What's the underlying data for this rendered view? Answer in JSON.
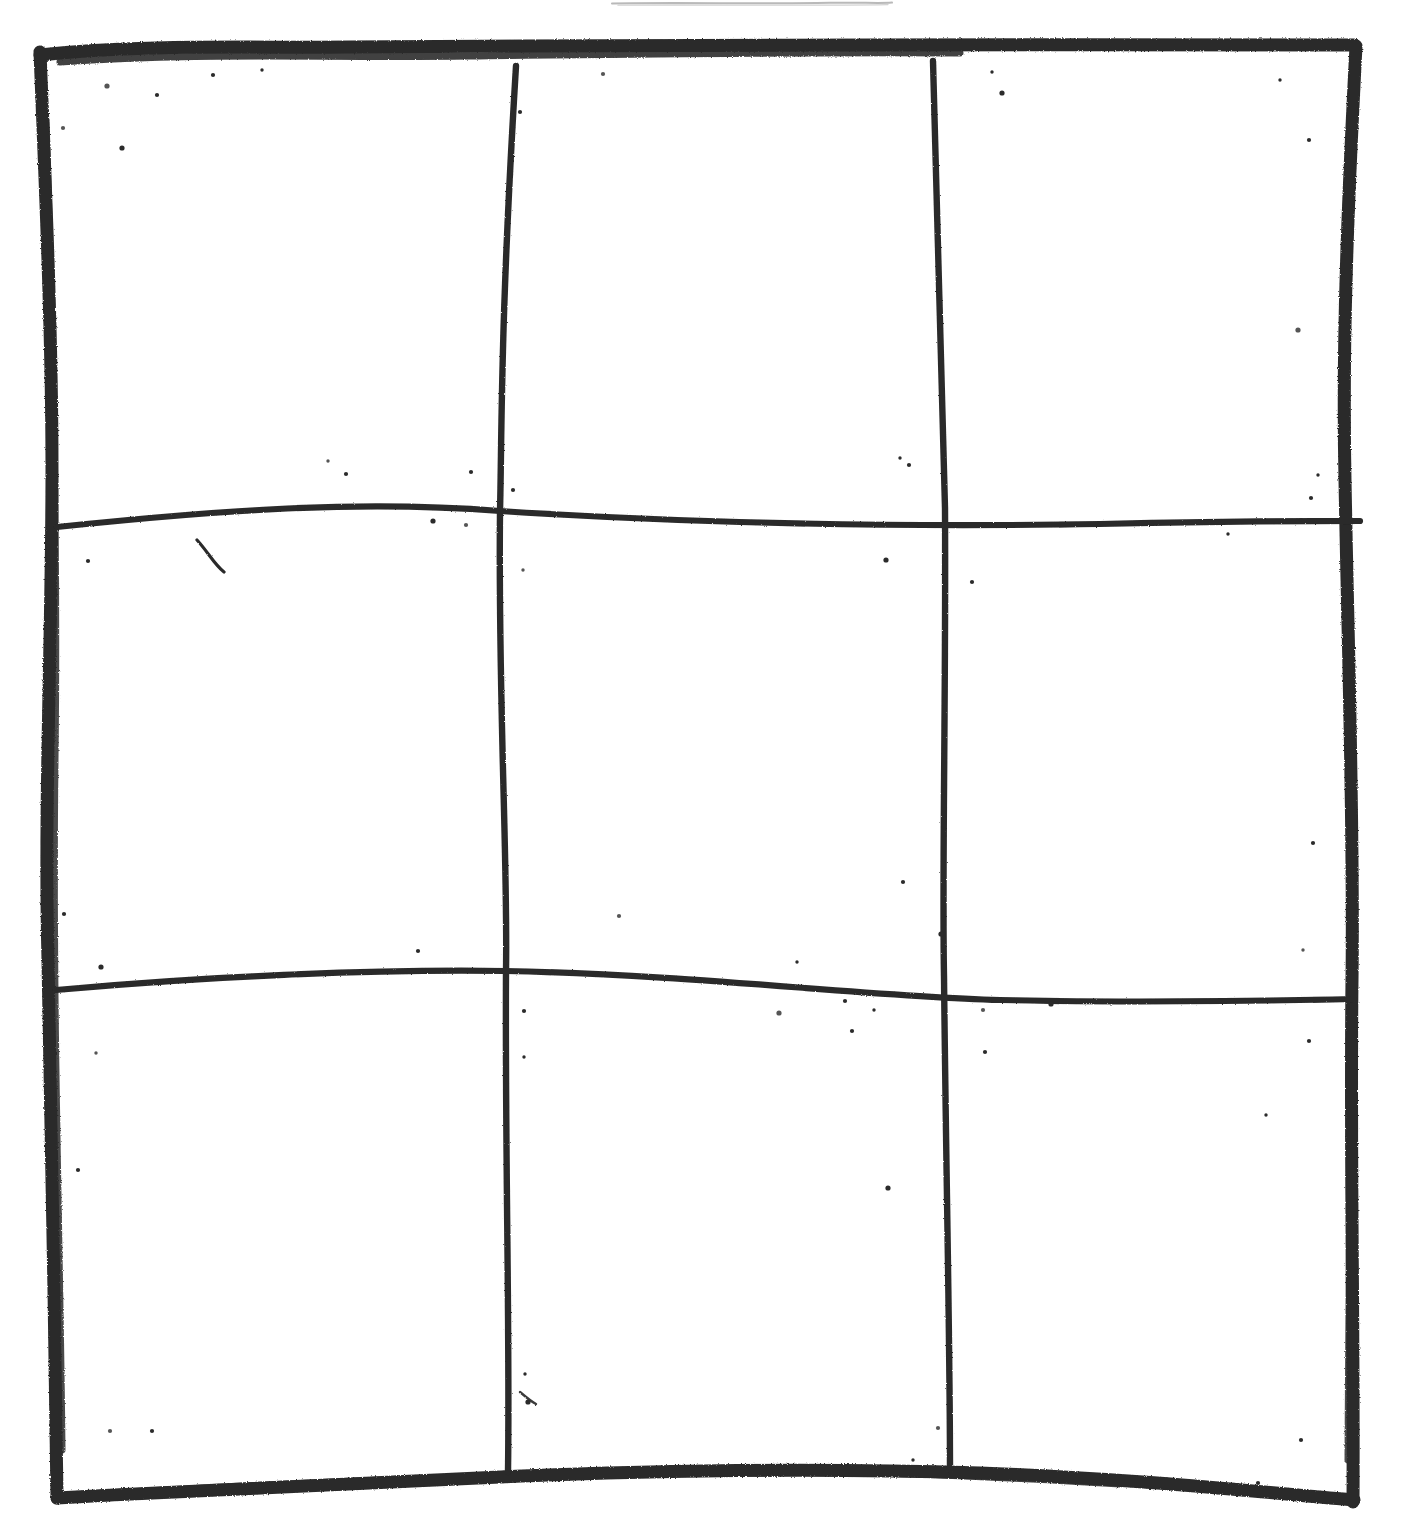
{
  "page": {
    "background_color": "#ffffff",
    "ink_color": "#2b2b2b",
    "ink_color_light": "#b9b9b9",
    "width": 1401,
    "height": 1540
  },
  "drawing": {
    "kind": "hand-drawn-grid",
    "medium": "thick black marker on white paper",
    "rows": 3,
    "columns": 3,
    "cell_count": 9,
    "border_stroke_width": 13,
    "interior_stroke_width": 6,
    "notes": "Empty tic-tac-toe style grid; no glyphs or text inside any cell; paper shows scattered dark speckles",
    "frame": {
      "top_left": [
        38,
        52
      ],
      "top_right": [
        1356,
        45
      ],
      "bottom_right": [
        1353,
        1500
      ],
      "bottom_left": [
        56,
        1496
      ]
    },
    "top_stray_mark": {
      "name": "faint-horizontal-pencil-line",
      "x1": 612,
      "x2": 892,
      "y": 3,
      "stroke_width": 2,
      "color": "#b9b9b9"
    },
    "interior_lines": [
      {
        "name": "vertical-line-1",
        "orientation": "vertical",
        "path": "M 516 66 C 500 330, 502 430, 500 512 C 498 700, 508 860, 506 972 C 505 1160, 510 1330, 508 1470"
      },
      {
        "name": "vertical-line-2",
        "orientation": "vertical",
        "path": "M 933 61 C 940 300, 944 430, 945 508 C 946 700, 942 870, 944 976 C 946 1170, 950 1340, 950 1468"
      },
      {
        "name": "horizontal-line-1",
        "orientation": "horizontal",
        "path": "M 57 527 C 220 510, 360 500, 500 511 C 700 524, 900 527, 1100 524 C 1220 521, 1300 521, 1358 521"
      },
      {
        "name": "horizontal-line-2",
        "orientation": "horizontal",
        "path": "M 56 990 C 200 977, 370 969, 505 971 C 700 975, 860 996, 1000 1000 C 1130 1003, 1260 1001, 1352 999"
      }
    ],
    "cells": [
      {
        "name": "cell-top-left",
        "row": 1,
        "col": 1,
        "content": ""
      },
      {
        "name": "cell-top-center",
        "row": 1,
        "col": 2,
        "content": ""
      },
      {
        "name": "cell-top-right",
        "row": 1,
        "col": 3,
        "content": ""
      },
      {
        "name": "cell-middle-left",
        "row": 2,
        "col": 1,
        "content": ""
      },
      {
        "name": "cell-middle-center",
        "row": 2,
        "col": 2,
        "content": ""
      },
      {
        "name": "cell-middle-right",
        "row": 2,
        "col": 3,
        "content": ""
      },
      {
        "name": "cell-bottom-left",
        "row": 3,
        "col": 1,
        "content": ""
      },
      {
        "name": "cell-bottom-center",
        "row": 3,
        "col": 2,
        "content": ""
      },
      {
        "name": "cell-bottom-right",
        "row": 3,
        "col": 3,
        "content": ""
      }
    ],
    "speckles": [
      [
        107,
        86
      ],
      [
        157,
        95
      ],
      [
        213,
        75
      ],
      [
        262,
        70
      ],
      [
        63,
        128
      ],
      [
        122,
        148
      ],
      [
        1280,
        80
      ],
      [
        1309,
        140
      ],
      [
        603,
        74
      ],
      [
        992,
        72
      ],
      [
        1002,
        93
      ],
      [
        520,
        112
      ],
      [
        328,
        461
      ],
      [
        346,
        474
      ],
      [
        471,
        472
      ],
      [
        433,
        521
      ],
      [
        466,
        525
      ],
      [
        513,
        490
      ],
      [
        900,
        458
      ],
      [
        909,
        465
      ],
      [
        1298,
        330
      ],
      [
        1318,
        475
      ],
      [
        1311,
        498
      ],
      [
        88,
        561
      ],
      [
        523,
        570
      ],
      [
        886,
        560
      ],
      [
        972,
        582
      ],
      [
        1228,
        534
      ],
      [
        1301,
        520
      ],
      [
        64,
        914
      ],
      [
        101,
        967
      ],
      [
        418,
        951
      ],
      [
        619,
        916
      ],
      [
        797,
        962
      ],
      [
        903,
        882
      ],
      [
        941,
        934
      ],
      [
        1303,
        950
      ],
      [
        1313,
        843
      ],
      [
        524,
        1011
      ],
      [
        524,
        1057
      ],
      [
        779,
        1013
      ],
      [
        845,
        1001
      ],
      [
        874,
        1010
      ],
      [
        852,
        1031
      ],
      [
        983,
        1010
      ],
      [
        1051,
        1004
      ],
      [
        985,
        1052
      ],
      [
        1309,
        1041
      ],
      [
        96,
        1053
      ],
      [
        78,
        1170
      ],
      [
        888,
        1188
      ],
      [
        1266,
        1115
      ],
      [
        110,
        1431
      ],
      [
        152,
        1431
      ],
      [
        525,
        1374
      ],
      [
        528,
        1402
      ],
      [
        938,
        1428
      ],
      [
        913,
        1460
      ],
      [
        1258,
        1483
      ],
      [
        1301,
        1440
      ]
    ]
  }
}
